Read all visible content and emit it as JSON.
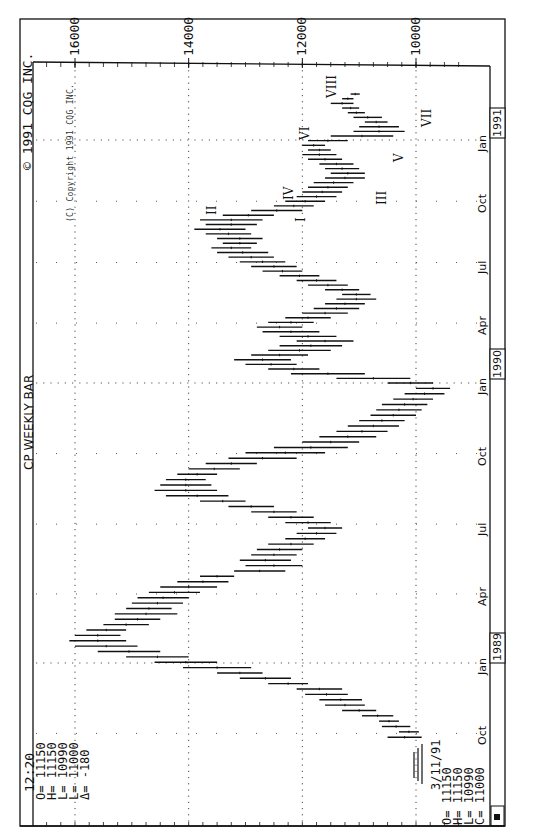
{
  "header": {
    "time": "12:20",
    "title": "CP WEEKLY BAR",
    "copyright": "© 1991 CQG INC.",
    "inner_copyright": "(C) Copyright 1991 CQG INC."
  },
  "last_bar_panel": {
    "O": "O= 11150",
    "H": "H= 11150",
    "L": "L= 10990",
    "L2": "L= 11000",
    "delta": "Δ= -180"
  },
  "current_bar_panel": {
    "date": "3/11/91",
    "O": "O= 11150",
    "H": "H= 11150",
    "L": "L= 10990",
    "C": "C= 11000"
  },
  "chart_data": {
    "type": "ohlc_bar",
    "orientation": "rotated 90° clockwise (price axis horizontal at top, time axis vertical on right)",
    "title": "CP WEEKLY BAR",
    "ylabel": "Price",
    "xlabel": "Date (weekly)",
    "price_ticks": [
      16000,
      14000,
      12000,
      10000
    ],
    "ylim": [
      9300,
      16600
    ],
    "time_ticks": [
      "Oct",
      "Jan",
      "Apr",
      "Jul",
      "Oct",
      "Jan",
      "Apr",
      "Jul",
      "Oct",
      "Jan"
    ],
    "year_labels": [
      "1989",
      "1990",
      "1991"
    ],
    "grid": true,
    "wave_labels": [
      "I",
      "II",
      "III",
      "IV",
      "V",
      "VI",
      "VII",
      "VIII"
    ],
    "series": [
      {
        "name": "CP weekly high-low ranges (approx.)",
        "values": [
          {
            "week": "1988-09-26",
            "high": 10500,
            "low": 9900
          },
          {
            "week": "1988-10-03",
            "high": 10300,
            "low": 9950
          },
          {
            "week": "1988-10-10",
            "high": 10600,
            "low": 10100
          },
          {
            "week": "1988-10-17",
            "high": 10650,
            "low": 10300
          },
          {
            "week": "1988-10-24",
            "high": 10950,
            "low": 10400
          },
          {
            "week": "1988-10-31",
            "high": 11300,
            "low": 10700
          },
          {
            "week": "1988-11-07",
            "high": 11600,
            "low": 10900
          },
          {
            "week": "1988-11-14",
            "high": 11700,
            "low": 10950
          },
          {
            "week": "1988-11-21",
            "high": 11950,
            "low": 11200
          },
          {
            "week": "1988-11-28",
            "high": 12100,
            "low": 11300
          },
          {
            "week": "1988-12-05",
            "high": 12600,
            "low": 11900
          },
          {
            "week": "1988-12-12",
            "high": 13100,
            "low": 12200
          },
          {
            "week": "1988-12-19",
            "high": 13500,
            "low": 12700
          },
          {
            "week": "1988-12-26",
            "high": 14100,
            "low": 12900
          },
          {
            "week": "1989-01-02",
            "high": 14600,
            "low": 13500
          },
          {
            "week": "1989-01-09",
            "high": 15100,
            "low": 14000
          },
          {
            "week": "1989-01-16",
            "high": 15600,
            "low": 14500
          },
          {
            "week": "1989-01-23",
            "high": 16000,
            "low": 14900
          },
          {
            "week": "1989-01-30",
            "high": 16100,
            "low": 15100
          },
          {
            "week": "1989-02-06",
            "high": 16000,
            "low": 15200
          },
          {
            "week": "1989-02-13",
            "high": 15800,
            "low": 15100
          },
          {
            "week": "1989-02-20",
            "high": 15500,
            "low": 14700
          },
          {
            "week": "1989-02-27",
            "high": 15300,
            "low": 14500
          },
          {
            "week": "1989-03-06",
            "high": 15300,
            "low": 14200
          },
          {
            "week": "1989-03-13",
            "high": 15100,
            "low": 14300
          },
          {
            "week": "1989-03-20",
            "high": 15000,
            "low": 14100
          },
          {
            "week": "1989-03-27",
            "high": 14900,
            "low": 14000
          },
          {
            "week": "1989-04-03",
            "high": 14700,
            "low": 13800
          },
          {
            "week": "1989-04-10",
            "high": 14500,
            "low": 13500
          },
          {
            "week": "1989-04-17",
            "high": 14200,
            "low": 13300
          },
          {
            "week": "1989-04-24",
            "high": 13800,
            "low": 13200
          },
          {
            "week": "1989-05-01",
            "high": 13200,
            "low": 12300
          },
          {
            "week": "1989-05-08",
            "high": 13000,
            "low": 12000
          },
          {
            "week": "1989-05-15",
            "high": 13100,
            "low": 12200
          },
          {
            "week": "1989-05-22",
            "high": 12900,
            "low": 12100
          },
          {
            "week": "1989-05-29",
            "high": 12800,
            "low": 12000
          },
          {
            "week": "1989-06-05",
            "high": 12600,
            "low": 11800
          },
          {
            "week": "1989-06-12",
            "high": 12300,
            "low": 11600
          },
          {
            "week": "1989-06-19",
            "high": 12100,
            "low": 11400
          },
          {
            "week": "1989-06-26",
            "high": 11900,
            "low": 11300
          },
          {
            "week": "1989-07-03",
            "high": 12300,
            "low": 11500
          },
          {
            "week": "1989-07-10",
            "high": 12600,
            "low": 11800
          },
          {
            "week": "1989-07-17",
            "high": 12900,
            "low": 12100
          },
          {
            "week": "1989-07-24",
            "high": 13300,
            "low": 12500
          },
          {
            "week": "1989-07-31",
            "high": 13800,
            "low": 13000
          },
          {
            "week": "1989-08-07",
            "high": 14400,
            "low": 13300
          },
          {
            "week": "1989-08-14",
            "high": 14600,
            "low": 13500
          },
          {
            "week": "1989-08-21",
            "high": 14500,
            "low": 13600
          },
          {
            "week": "1989-08-28",
            "high": 14400,
            "low": 13700
          },
          {
            "week": "1989-09-04",
            "high": 14200,
            "low": 13500
          },
          {
            "week": "1989-09-11",
            "high": 14000,
            "low": 13100
          },
          {
            "week": "1989-09-18",
            "high": 13700,
            "low": 12800
          },
          {
            "week": "1989-09-25",
            "high": 13300,
            "low": 12100
          },
          {
            "week": "1989-10-02",
            "high": 13000,
            "low": 11600
          },
          {
            "week": "1989-10-09",
            "high": 12500,
            "low": 11200
          },
          {
            "week": "1989-10-16",
            "high": 12000,
            "low": 11000
          },
          {
            "week": "1989-10-23",
            "high": 11700,
            "low": 10700
          },
          {
            "week": "1989-10-30",
            "high": 11400,
            "low": 10500
          },
          {
            "week": "1989-11-06",
            "high": 11200,
            "low": 10300
          },
          {
            "week": "1989-11-13",
            "high": 11000,
            "low": 10200
          },
          {
            "week": "1989-11-20",
            "high": 10800,
            "low": 10000
          },
          {
            "week": "1989-11-27",
            "high": 10700,
            "low": 9900
          },
          {
            "week": "1989-12-04",
            "high": 10600,
            "low": 9800
          },
          {
            "week": "1989-12-11",
            "high": 10400,
            "low": 9700
          },
          {
            "week": "1989-12-18",
            "high": 10200,
            "low": 9500
          },
          {
            "week": "1989-12-25",
            "high": 10000,
            "low": 9400
          },
          {
            "week": "1990-01-01",
            "high": 10500,
            "low": 9700
          },
          {
            "week": "1990-01-08",
            "high": 11400,
            "low": 10100
          },
          {
            "week": "1990-01-15",
            "high": 12200,
            "low": 10900
          },
          {
            "week": "1990-01-22",
            "high": 12600,
            "low": 11700
          },
          {
            "week": "1990-01-29",
            "high": 13000,
            "low": 12100
          },
          {
            "week": "1990-02-05",
            "high": 13200,
            "low": 12200
          },
          {
            "week": "1990-02-12",
            "high": 12900,
            "low": 11900
          },
          {
            "week": "1990-02-19",
            "high": 12600,
            "low": 11500
          },
          {
            "week": "1990-02-26",
            "high": 12400,
            "low": 11300
          },
          {
            "week": "1990-03-05",
            "high": 12100,
            "low": 11100
          },
          {
            "week": "1990-03-12",
            "high": 12400,
            "low": 11400
          },
          {
            "week": "1990-03-19",
            "high": 12700,
            "low": 11700
          },
          {
            "week": "1990-03-26",
            "high": 12800,
            "low": 12000
          },
          {
            "week": "1990-04-02",
            "high": 12600,
            "low": 11800
          },
          {
            "week": "1990-04-09",
            "high": 12300,
            "low": 11500
          },
          {
            "week": "1990-04-16",
            "high": 12000,
            "low": 11200
          },
          {
            "week": "1990-04-23",
            "high": 11800,
            "low": 11000
          },
          {
            "week": "1990-04-30",
            "high": 11600,
            "low": 10900
          },
          {
            "week": "1990-05-07",
            "high": 11400,
            "low": 10700
          },
          {
            "week": "1990-05-14",
            "high": 11300,
            "low": 10800
          },
          {
            "week": "1990-05-21",
            "high": 11600,
            "low": 11000
          },
          {
            "week": "1990-05-28",
            "high": 11900,
            "low": 11200
          },
          {
            "week": "1990-06-04",
            "high": 12100,
            "low": 11400
          },
          {
            "week": "1990-06-11",
            "high": 12400,
            "low": 11700
          },
          {
            "week": "1990-06-18",
            "high": 12700,
            "low": 12000
          },
          {
            "week": "1990-06-25",
            "high": 12900,
            "low": 12100
          },
          {
            "week": "1990-07-02",
            "high": 13100,
            "low": 12300
          },
          {
            "week": "1990-07-09",
            "high": 13300,
            "low": 12500
          },
          {
            "week": "1990-07-16",
            "high": 13500,
            "low": 12600
          },
          {
            "week": "1990-07-23",
            "high": 13600,
            "low": 12900
          },
          {
            "week": "1990-07-30",
            "high": 13400,
            "low": 12800
          },
          {
            "week": "1990-08-06",
            "high": 13500,
            "low": 12700
          },
          {
            "week": "1990-08-13",
            "high": 13700,
            "low": 12900
          },
          {
            "week": "1990-08-20",
            "high": 13900,
            "low": 13000
          },
          {
            "week": "1990-08-27",
            "high": 13700,
            "low": 12800
          },
          {
            "week": "1990-09-03",
            "high": 13800,
            "low": 12700
          },
          {
            "week": "1990-09-10",
            "high": 13400,
            "low": 12500
          },
          {
            "week": "1990-09-17",
            "high": 12900,
            "low": 12000
          },
          {
            "week": "1990-09-24",
            "high": 12500,
            "low": 11800
          },
          {
            "week": "1990-10-01",
            "high": 12300,
            "low": 11600
          },
          {
            "week": "1990-10-08",
            "high": 12100,
            "low": 11400
          },
          {
            "week": "1990-10-15",
            "high": 12000,
            "low": 11300
          },
          {
            "week": "1990-10-22",
            "high": 11900,
            "low": 11200
          },
          {
            "week": "1990-10-29",
            "high": 11800,
            "low": 11100
          },
          {
            "week": "1990-11-05",
            "high": 11600,
            "low": 10900
          },
          {
            "week": "1990-11-12",
            "high": 11500,
            "low": 10900
          },
          {
            "week": "1990-11-19",
            "high": 11600,
            "low": 11000
          },
          {
            "week": "1990-11-26",
            "high": 11700,
            "low": 11100
          },
          {
            "week": "1990-12-03",
            "high": 11900,
            "low": 11300
          },
          {
            "week": "1990-12-10",
            "high": 12000,
            "low": 11400
          },
          {
            "week": "1990-12-17",
            "high": 11900,
            "low": 11500
          },
          {
            "week": "1990-12-24",
            "high": 12000,
            "low": 11600
          },
          {
            "week": "1990-12-31",
            "high": 11900,
            "low": 11200
          },
          {
            "week": "1991-01-07",
            "high": 11500,
            "low": 10400
          },
          {
            "week": "1991-01-14",
            "high": 11100,
            "low": 10200
          },
          {
            "week": "1991-01-21",
            "high": 11000,
            "low": 10300
          },
          {
            "week": "1991-01-28",
            "high": 10900,
            "low": 10500
          },
          {
            "week": "1991-02-04",
            "high": 11100,
            "low": 10600
          },
          {
            "week": "1991-02-11",
            "high": 11200,
            "low": 10900
          },
          {
            "week": "1991-02-18",
            "high": 11300,
            "low": 11000
          },
          {
            "week": "1991-02-25",
            "high": 11500,
            "low": 11100
          },
          {
            "week": "1991-03-04",
            "high": 11300,
            "low": 11100
          },
          {
            "week": "1991-03-11",
            "high": 11150,
            "low": 10990
          }
        ]
      }
    ]
  }
}
